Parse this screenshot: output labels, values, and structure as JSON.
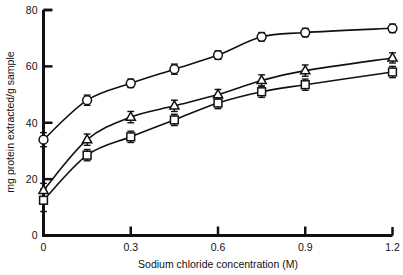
{
  "chart_data": {
    "type": "line",
    "title": "",
    "xlabel": "Sodium chloride concentration (M)",
    "ylabel": "mg protein extracted/g sample",
    "xlim": [
      0,
      1.2
    ],
    "ylim": [
      0,
      80
    ],
    "xticks": [
      0,
      0.3,
      0.6,
      0.9,
      1.2
    ],
    "xtick_labels": [
      "0",
      "0.3",
      "0.6",
      "0.9",
      "1.2"
    ],
    "yticks": [
      0,
      20,
      40,
      60,
      80
    ],
    "ytick_labels": [
      "0",
      "20",
      "40",
      "60",
      "80"
    ],
    "grid": false,
    "legend": "none",
    "x": [
      0,
      0.15,
      0.3,
      0.45,
      0.6,
      0.75,
      0.9,
      1.2
    ],
    "series": [
      {
        "name": "circle-series",
        "marker": "circle",
        "values": [
          34,
          48,
          54,
          59,
          64,
          70.5,
          72,
          73.5
        ],
        "errors": [
          2.5,
          1.8,
          1.5,
          1.8,
          1.5,
          1.5,
          1.5,
          1.5
        ]
      },
      {
        "name": "triangle-series",
        "marker": "triangle",
        "values": [
          16,
          34,
          42,
          46,
          50,
          55,
          58.5,
          63
        ],
        "errors": [
          2.5,
          2.0,
          2.0,
          2.0,
          1.8,
          2.0,
          2.0,
          1.8
        ]
      },
      {
        "name": "square-series",
        "marker": "square",
        "values": [
          12.5,
          28.5,
          35,
          41,
          47,
          51,
          53.5,
          58
        ],
        "errors": [
          4.0,
          2.0,
          2.0,
          2.0,
          2.0,
          2.0,
          2.0,
          2.0
        ]
      }
    ],
    "colors": {
      "axis": "#111111",
      "line": "#111111",
      "marker_fill": "#ffffff",
      "marker_stroke": "#111111",
      "background": "#ffffff"
    }
  }
}
